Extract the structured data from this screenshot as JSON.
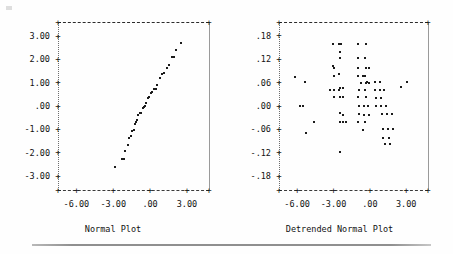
{
  "figure": {
    "background": "#fefefe",
    "ink_color": "#1b1b1b",
    "axis_color": "#6d6d6d",
    "rule_color": "#8f8f8f"
  },
  "chart_data": [
    {
      "type": "scatter",
      "title": "Normal Plot",
      "xlabel": "",
      "ylabel": "",
      "grid": false,
      "legend": "none",
      "xlim": [
        -7.5,
        4.8
      ],
      "ylim": [
        -3.6,
        3.6
      ],
      "xticks": [
        -6.0,
        -3.0,
        0.0,
        3.0
      ],
      "xticklabels": [
        "-6.00",
        "-3.00",
        ".00",
        "3.00"
      ],
      "yticks": [
        3.0,
        2.0,
        1.0,
        0.0,
        -1.0,
        -2.0,
        -3.0
      ],
      "yticklabels": [
        "3.00",
        "2.00",
        "1.00",
        ".00",
        "-1.00",
        "-2.00",
        "-3.00"
      ],
      "x": [
        -2.85,
        -2.3,
        -2.1,
        -2.05,
        -1.8,
        -1.7,
        -1.55,
        -1.45,
        -1.3,
        -1.2,
        -1.15,
        -1.05,
        -0.95,
        -0.8,
        -0.7,
        -0.6,
        -0.5,
        -0.45,
        -0.3,
        -0.2,
        -0.1,
        0.05,
        0.15,
        0.3,
        0.45,
        0.6,
        0.8,
        0.95,
        1.15,
        1.35,
        1.55,
        1.75,
        1.95,
        2.15,
        2.55
      ],
      "y": [
        -2.62,
        -2.28,
        -2.28,
        -1.92,
        -1.68,
        -1.38,
        -1.3,
        -1.08,
        -1.03,
        -0.78,
        -0.7,
        -0.58,
        -0.4,
        -0.32,
        -0.28,
        -0.1,
        -0.05,
        0.02,
        0.12,
        0.35,
        0.4,
        0.55,
        0.62,
        0.72,
        0.72,
        0.92,
        1.18,
        1.38,
        1.42,
        1.62,
        1.75,
        2.08,
        2.12,
        2.4,
        2.72
      ]
    },
    {
      "type": "scatter",
      "title": "Detrended Normal Plot",
      "xlabel": "",
      "ylabel": "",
      "grid": false,
      "legend": "none",
      "xlim": [
        -7.5,
        4.8
      ],
      "ylim": [
        -0.215,
        0.215
      ],
      "xticks": [
        -6.0,
        -3.0,
        0.0,
        3.0
      ],
      "xticklabels": [
        "-6.00",
        "-3.00",
        ".00",
        "3.00"
      ],
      "yticks": [
        0.18,
        0.12,
        0.06,
        0.0,
        -0.06,
        -0.12,
        -0.18
      ],
      "yticklabels": [
        ".18",
        ".12",
        ".06",
        ".00",
        "-.06",
        "-.12",
        "-.18"
      ],
      "x": [
        -6.15,
        -5.35,
        -5.75,
        -5.55,
        -5.3,
        -4.65,
        -3.05,
        -2.55,
        -2.4,
        -3.05,
        -2.45,
        -2.95,
        -2.5,
        -3.0,
        -2.55,
        -2.95,
        -2.55,
        -3.25,
        -3.0,
        -2.45,
        -2.25,
        -2.5,
        -2.2,
        -2.45,
        -2.2,
        -2.45,
        -2.2,
        -1.95,
        -2.45,
        -0.95,
        -0.35,
        -0.95,
        -0.4,
        -0.95,
        -0.35,
        -0.1,
        -0.95,
        -0.4,
        -0.6,
        -0.2,
        -0.75,
        -0.3,
        -0.05,
        -0.9,
        -0.4,
        -0.95,
        -0.35,
        -0.9,
        -0.45,
        -0.15,
        -0.9,
        -0.45,
        -0.1,
        -0.95,
        -0.4,
        -0.6,
        0.45,
        0.8,
        0.45,
        0.8,
        1.15,
        0.5,
        0.9,
        0.5,
        0.95,
        1.3,
        1.0,
        1.4,
        1.8,
        1.05,
        1.5,
        1.95,
        1.1,
        1.55,
        1.25,
        1.7,
        3.1,
        2.55
      ],
      "y": [
        0.075,
        0.062,
        0.0,
        0.0,
        -0.07,
        -0.04,
        0.158,
        0.158,
        0.158,
        0.102,
        0.138,
        0.098,
        0.122,
        0.078,
        0.082,
        0.04,
        0.042,
        0.04,
        0.022,
        0.045,
        0.045,
        0.022,
        0.022,
        -0.018,
        -0.022,
        -0.04,
        -0.042,
        -0.042,
        -0.118,
        0.158,
        0.158,
        0.122,
        0.122,
        0.098,
        0.098,
        0.098,
        0.078,
        0.078,
        0.078,
        0.062,
        0.06,
        0.06,
        0.06,
        0.04,
        0.042,
        0.022,
        0.022,
        0.0,
        0.0,
        0.0,
        -0.02,
        -0.022,
        -0.022,
        -0.042,
        -0.042,
        -0.062,
        0.062,
        0.062,
        0.04,
        0.04,
        0.04,
        0.02,
        0.02,
        0.0,
        0.0,
        0.0,
        -0.02,
        -0.02,
        -0.02,
        -0.058,
        -0.058,
        -0.058,
        -0.082,
        -0.082,
        -0.098,
        -0.098,
        0.062,
        0.048
      ]
    }
  ],
  "left_plot": {
    "title": "Normal Plot",
    "yticklabels": [
      "3.00",
      "2.00",
      "1.00",
      ".00",
      "-1.00",
      "-2.00",
      "-3.00"
    ],
    "xticklabels": [
      "-6.00",
      "-3.00",
      ".00",
      "3.00"
    ],
    "tick_glyph": "+"
  },
  "right_plot": {
    "title": "Detrended Normal Plot",
    "yticklabels": [
      ".18",
      ".12",
      ".06",
      ".00",
      "-.06",
      "-.12",
      "-.18"
    ],
    "xticklabels": [
      "-6.00",
      "-3.00",
      ".00",
      "3.00"
    ],
    "tick_glyph": "+"
  }
}
